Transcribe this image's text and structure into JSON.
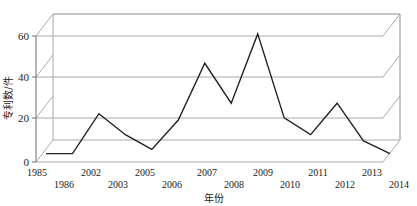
{
  "chart_data": {
    "type": "line",
    "title": "",
    "xlabel": "年份",
    "ylabel": "专利数/件",
    "categories": [
      "1985",
      "1986",
      "2002",
      "2003",
      "2005",
      "2006",
      "2007",
      "2008",
      "2009",
      "2010",
      "2011",
      "2012",
      "2013",
      "2014"
    ],
    "values": [
      4,
      4,
      23,
      13,
      6,
      20,
      47,
      28,
      61,
      21,
      13,
      28,
      10,
      4
    ],
    "series": [
      {
        "name": "专利数",
        "values": [
          4,
          4,
          23,
          13,
          6,
          20,
          47,
          28,
          61,
          21,
          13,
          28,
          10,
          4
        ]
      }
    ],
    "ylim": [
      0,
      65
    ],
    "yticks": [
      0,
      20,
      40,
      60
    ],
    "ytick_labels": [
      "0",
      "20",
      "40",
      "60"
    ],
    "grid": true,
    "gridlines_y": [
      20,
      40,
      60
    ],
    "legend": "none",
    "style": "3d-line",
    "line_color": "#232323",
    "grid_color": "#aaaaaa",
    "axis_color": "#6e6e6e"
  },
  "axes": {
    "y_title": "专利数/件",
    "x_title": "年份",
    "y_ticks": [
      "0",
      "20",
      "40",
      "60"
    ],
    "x_ticks_row_top": [
      "1985",
      "2002",
      "2005",
      "2007",
      "2009",
      "2011",
      "2013"
    ],
    "x_ticks_row_bottom": [
      "1986",
      "2003",
      "2006",
      "2008",
      "2010",
      "2012",
      "2014"
    ]
  }
}
